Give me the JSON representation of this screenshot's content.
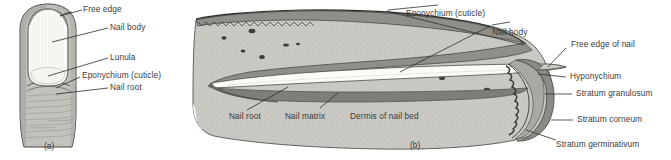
{
  "figure": {
    "background_color": "#ffffff",
    "palette": {
      "skin_gray": "#c9c8c3",
      "skin_gray_dark": "#a8a7a2",
      "nail_plate_white": "#fbfbf8",
      "nail_fold_dark": "#7e7d79",
      "stratum_dark": "#5a5955",
      "outline": "#3a3a38",
      "label_text": "#3a3a3a"
    }
  },
  "panel_a": {
    "id_label": "(a)",
    "caption": "Surface view of fingertip and nail",
    "labels": [
      {
        "key": "free_edge",
        "text": "Free edge"
      },
      {
        "key": "nail_body",
        "text": "Nail body"
      },
      {
        "key": "lunula",
        "text": "Lunula"
      },
      {
        "key": "eponychium",
        "text": "Eponychium (cuticle)"
      },
      {
        "key": "nail_root",
        "text": "Nail root"
      }
    ]
  },
  "panel_b": {
    "id_label": "(b)",
    "caption": "Sagittal section through nail and nail bed",
    "labels": [
      {
        "key": "eponychium",
        "text": "Eponychium (cuticle)"
      },
      {
        "key": "nail_body",
        "text": "Nail body"
      },
      {
        "key": "free_edge_of_nail",
        "text": "Free edge of nail"
      },
      {
        "key": "hyponychium",
        "text": "Hyponychium"
      },
      {
        "key": "stratum_granulosum",
        "text": "Stratum granulosum"
      },
      {
        "key": "stratum_corneum",
        "text": "Stratum corneum"
      },
      {
        "key": "stratum_germinativum",
        "text": "Stratum germinativum"
      },
      {
        "key": "nail_root",
        "text": "Nail root"
      },
      {
        "key": "nail_matrix",
        "text": "Nail matrix"
      },
      {
        "key": "dermis_of_nail_bed",
        "text": "Dermis of nail bed"
      }
    ]
  }
}
